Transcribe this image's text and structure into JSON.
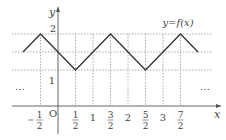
{
  "figure": {
    "function_label": "y=f(x)",
    "axis_labels": {
      "x": "x",
      "y": "y",
      "origin": "O"
    },
    "y_ticks": [
      {
        "value": 2,
        "label": "2"
      },
      {
        "value": 1,
        "label": "1"
      }
    ],
    "x_ticks": [
      {
        "value": -0.5,
        "label": "-1/2",
        "num": "1",
        "den": "2",
        "neg": true
      },
      {
        "value": 0.5,
        "label": "1/2",
        "num": "1",
        "den": "2"
      },
      {
        "value": 1,
        "label": "1"
      },
      {
        "value": 1.5,
        "label": "3/2",
        "num": "3",
        "den": "2"
      },
      {
        "value": 2,
        "label": "2"
      },
      {
        "value": 2.5,
        "label": "5/2",
        "num": "5",
        "den": "2"
      },
      {
        "value": 3,
        "label": "3"
      },
      {
        "value": 3.5,
        "label": "7/2",
        "num": "7",
        "den": "2"
      }
    ],
    "ellipsis_left": "…",
    "ellipsis_right": "…",
    "polyline_points": [
      [
        -1,
        1.5
      ],
      [
        -0.5,
        2
      ],
      [
        0.5,
        1
      ],
      [
        1.5,
        2
      ],
      [
        2.5,
        1
      ],
      [
        3.5,
        2
      ],
      [
        4,
        1.5
      ]
    ],
    "colors": {
      "curve": "#333333",
      "axis": "#555555",
      "guide": "#999999",
      "text": "#444444"
    }
  }
}
